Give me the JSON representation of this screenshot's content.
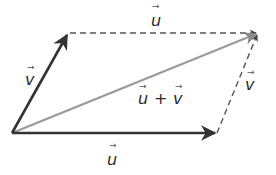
{
  "diagram": {
    "colors": {
      "solid_vector": "#333333",
      "resultant_vector": "#9a9a9a",
      "dashed_vector": "#555555",
      "background": "#ffffff"
    },
    "points": {
      "origin": [
        12,
        133
      ],
      "v_tip": [
        68,
        33
      ],
      "sum_tip": [
        258,
        33
      ],
      "u_tip": [
        217,
        133
      ]
    },
    "vectors": [
      {
        "name": "v",
        "from": "origin",
        "to": "v_tip",
        "style": "solid"
      },
      {
        "name": "u",
        "from": "origin",
        "to": "u_tip",
        "style": "solid"
      },
      {
        "name": "u + v",
        "from": "origin",
        "to": "sum_tip",
        "style": "solid-gray"
      },
      {
        "name": "u",
        "from": "v_tip",
        "to": "sum_tip",
        "style": "dashed"
      },
      {
        "name": "v",
        "from": "u_tip",
        "to": "sum_tip",
        "style": "dashed"
      }
    ],
    "labels": {
      "top_u": "u",
      "left_v": "v",
      "right_v": "v",
      "bottom_u": "u",
      "sum_u": "u",
      "sum_plus": "+",
      "sum_v": "v",
      "vector_arrow": "→"
    }
  }
}
